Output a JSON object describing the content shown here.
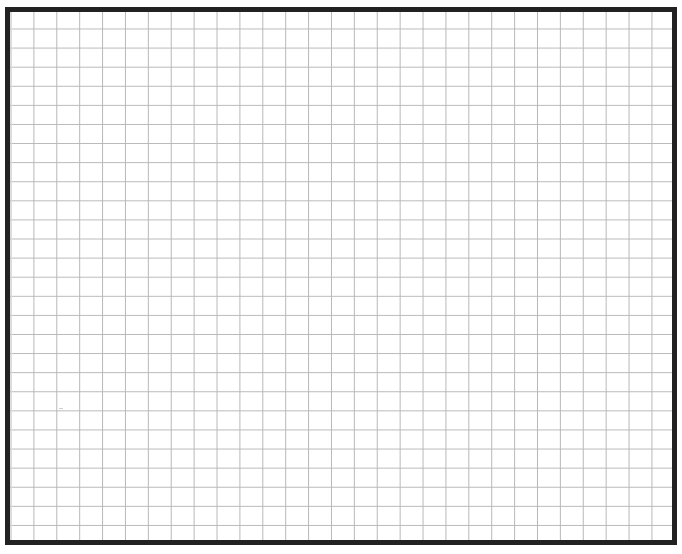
{
  "canvas": {
    "width": 682,
    "height": 554,
    "background": "#ffffff"
  },
  "grid_sheet": {
    "border_color": "#222222",
    "border_width_px": 5,
    "line_color": "#b8b8b8",
    "cell_width_px": 22.9,
    "cell_height_px": 19.1,
    "columns": 29,
    "rows": 27,
    "content": "empty"
  }
}
